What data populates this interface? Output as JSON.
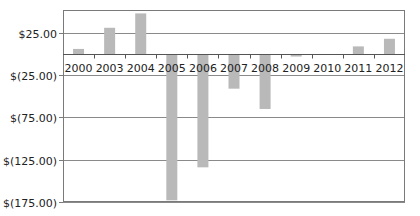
{
  "chart_data": {
    "type": "bar",
    "title": "",
    "xlabel": "",
    "ylabel": "",
    "categories": [
      "2000",
      "2003",
      "2004",
      "2005",
      "2006",
      "2007",
      "2008",
      "2009",
      "2010",
      "2011",
      "2012"
    ],
    "values": [
      6,
      31,
      48,
      -173,
      -134,
      -41,
      -65,
      -3,
      0,
      9,
      18
    ],
    "ylim": [
      -175,
      52
    ],
    "yticks": [
      25,
      -25,
      -75,
      -125,
      -175
    ],
    "ytick_labels": [
      "$25.00",
      "$(25.00)",
      "$(75.00)",
      "$(125.00)",
      "$(175.00)"
    ],
    "grid": true,
    "legend": null,
    "bar_color": "#b9b9b9",
    "grid_color": "#8a8a8a",
    "border_color": "#7a7a7a"
  }
}
